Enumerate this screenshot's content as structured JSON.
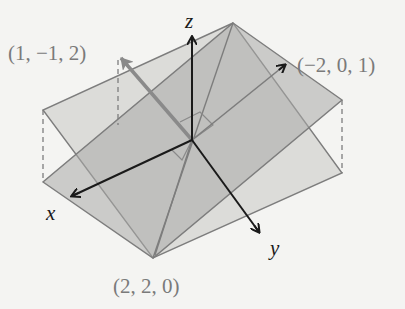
{
  "figure": {
    "axes": {
      "x_label": "x",
      "y_label": "y",
      "z_label": "z"
    },
    "points": [
      {
        "id": "normal-1",
        "label": "(1, −1, 2)"
      },
      {
        "id": "normal-2",
        "label": "(−2, 0, 1)"
      },
      {
        "id": "intersection-point",
        "label": "(2, 2, 0)"
      }
    ],
    "colors": {
      "background": "#f4f4f2",
      "plane_light": "#d9d9d7",
      "plane_dark": "#b8b8b6",
      "edge": "#7a7a7a",
      "axis": "#1a1a1a",
      "vector": "#8a8a8a"
    }
  }
}
